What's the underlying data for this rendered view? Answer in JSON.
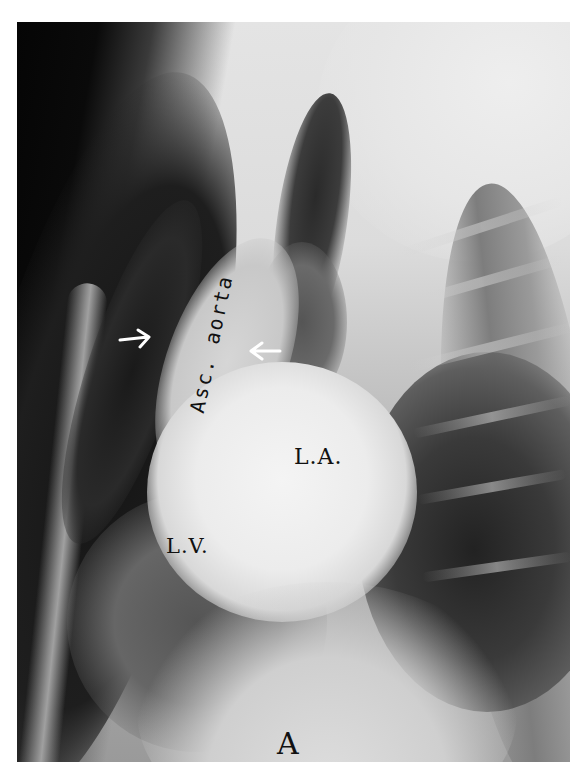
{
  "figure": {
    "type": "lateral chest radiograph",
    "panel_label": "A",
    "annotations": {
      "ascending_aorta": "Asc. aorta",
      "left_atrium": "L.A.",
      "left_ventricle": "L.V."
    },
    "arrows": [
      {
        "name": "arrow-anterior-aortic-wall",
        "direction": "right",
        "color": "#ffffff"
      },
      {
        "name": "arrow-posterior-aortic-wall",
        "direction": "left",
        "color": "#ffffff"
      }
    ],
    "colors": {
      "background": "#ffffff",
      "label_text": "#111111",
      "arrow": "#ffffff"
    }
  }
}
